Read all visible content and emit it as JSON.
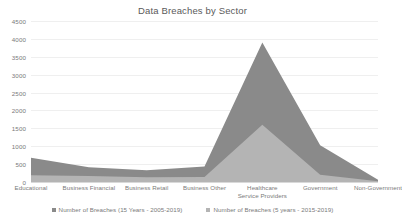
{
  "chart_data": {
    "type": "area",
    "title": "Data Breaches by Sector",
    "xlabel": "",
    "ylabel": "",
    "ylim": [
      0,
      4500
    ],
    "ytick_step": 500,
    "grid": true,
    "legend_position": "bottom",
    "yticks": [
      "4500",
      "4000",
      "3500",
      "3000",
      "2500",
      "2000",
      "1500",
      "1000",
      "500",
      "0"
    ],
    "categories": [
      "Educational",
      "Business Financial",
      "Business Retail",
      "Business Other",
      "Healthcare Service Providers",
      "Government",
      "Non-Government"
    ],
    "categories_lines": [
      [
        "Educational"
      ],
      [
        "Business Financial"
      ],
      [
        "Business Retail"
      ],
      [
        "Business Other"
      ],
      [
        "Healthcare",
        "Service Providers"
      ],
      [
        "Government"
      ],
      [
        "Non-Government"
      ]
    ],
    "series": [
      {
        "name": "Number of Breaches (15 Years - 2005-2019)",
        "color": "#8a8a8a",
        "values": [
          680,
          410,
          330,
          430,
          3900,
          1030,
          60
        ]
      },
      {
        "name": "Number of Breaches (5 years - 2015-2019)",
        "color": "#b4b4b4",
        "values": [
          190,
          165,
          130,
          140,
          1600,
          200,
          20
        ]
      }
    ]
  },
  "colors": {
    "series_dark": "#8a8a8a",
    "series_light": "#b4b4b4",
    "gridline": "#efefef",
    "axis": "#d9d9d9",
    "text": "#7a7a7a",
    "title": "#5a5a5a",
    "background": "#ffffff"
  }
}
